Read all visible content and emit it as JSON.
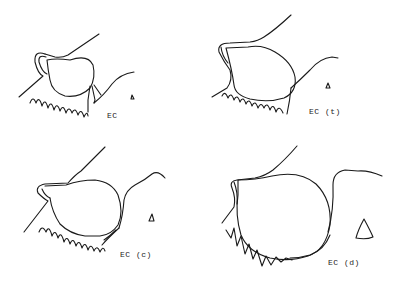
{
  "figure": {
    "panels": [
      {
        "id": "a",
        "label": "EC",
        "marker": "small-triangle"
      },
      {
        "id": "b",
        "label": "EC (t)",
        "marker": "small-triangle"
      },
      {
        "id": "c",
        "label": "EC (c)",
        "marker": "small-triangle"
      },
      {
        "id": "d",
        "label": "EC (d)",
        "marker": "large-triangle"
      }
    ]
  }
}
